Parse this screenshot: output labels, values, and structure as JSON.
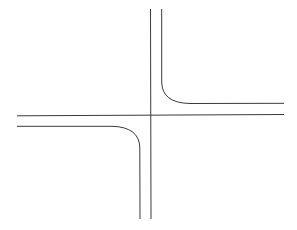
{
  "diagram": {
    "type": "road-intersection",
    "stroke_color": "#3a3a3a",
    "stroke_width": 1,
    "background": "#ffffff",
    "lines": {
      "vertical_main": {
        "x": 151,
        "y1": 9,
        "y2": 219
      },
      "horizontal_main": {
        "x1": 17,
        "x2": 284,
        "y1": 116,
        "y2": 114
      },
      "upper_right_curb": {
        "start_x": 162,
        "start_y": 9,
        "corner_y": 84,
        "end_x": 284,
        "end_y": 103
      },
      "lower_left_curb": {
        "start_x": 17,
        "start_y": 126,
        "corner_x": 112,
        "end_x": 140,
        "end_y": 219
      }
    }
  }
}
